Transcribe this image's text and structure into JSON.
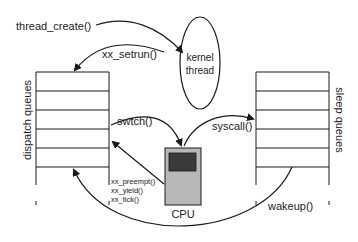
{
  "diagram": {
    "labels": {
      "thread_create": "thread_create()",
      "xx_setrun": "xx_setrun()",
      "kernel_thread_line1": "kernel",
      "kernel_thread_line2": "thread",
      "dispatch_queues": "dispatch queues",
      "sleep_queues": "sleep queues",
      "swtch": "swtch()",
      "syscall": "syscall()",
      "xx_preempt": "xx_preempt()",
      "xx_yield": "xx_yield()",
      "xx_tick": "xx_tick()",
      "cpu": "CPU",
      "wakeup": "wakeup()"
    },
    "colors": {
      "line": "#1a1a1a",
      "cpu_body": "#b8b8b8",
      "cpu_screen": "#3a3a3a",
      "background": "#ffffff"
    }
  }
}
